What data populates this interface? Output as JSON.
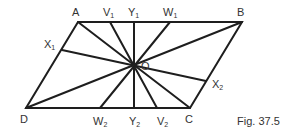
{
  "caption": "Fig. 37.5",
  "points": {
    "A": {
      "label": "A",
      "sub": "",
      "x": 78,
      "y": 22
    },
    "B": {
      "label": "B",
      "sub": "",
      "x": 242,
      "y": 22
    },
    "C": {
      "label": "C",
      "sub": "",
      "x": 190,
      "y": 108
    },
    "D": {
      "label": "D",
      "sub": "",
      "x": 26,
      "y": 108
    },
    "O": {
      "label": "O",
      "sub": "",
      "x": 134,
      "y": 65
    },
    "V1": {
      "label": "V",
      "sub": "1",
      "x": 110,
      "y": 22
    },
    "Y1": {
      "label": "Y",
      "sub": "1",
      "x": 134,
      "y": 22
    },
    "W1": {
      "label": "W",
      "sub": "1",
      "x": 170,
      "y": 22
    },
    "X1": {
      "label": "X",
      "sub": "1",
      "x": 62,
      "y": 50
    },
    "W2": {
      "label": "W",
      "sub": "2",
      "x": 100,
      "y": 108
    },
    "Y2": {
      "label": "Y",
      "sub": "2",
      "x": 134,
      "y": 108
    },
    "V2": {
      "label": "V",
      "sub": "2",
      "x": 157,
      "y": 108
    },
    "X2": {
      "label": "X",
      "sub": "2",
      "x": 206,
      "y": 81
    }
  },
  "shape": "parallelogram ABCD",
  "segments_through_O": [
    "AC",
    "BD",
    "V1V2",
    "Y1Y2",
    "W1W2",
    "X1X2"
  ]
}
